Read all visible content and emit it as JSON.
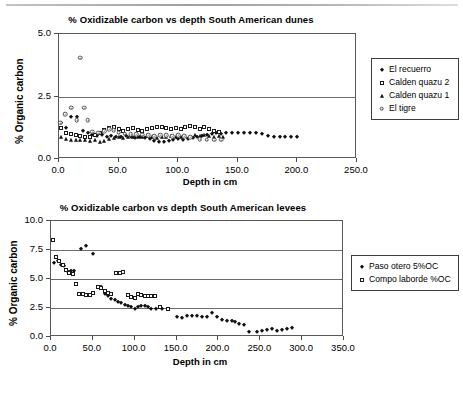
{
  "figures": [
    {
      "id": "dunes",
      "title": "% Oxidizable carbon vs depth South American dunes",
      "xlabel": "Depth in cm",
      "ylabel": "% Organic carbon",
      "xticks": [
        "0.0",
        "50.0",
        "100.0",
        "150.0",
        "200.0",
        "250.0"
      ],
      "yticks": [
        "0.0",
        "2.5",
        "5.0"
      ],
      "legend": [
        {
          "label": "El recuerro",
          "marker": "diamond"
        },
        {
          "label": "Calden quazu 2",
          "marker": "square"
        },
        {
          "label": "Calden quazu 1",
          "marker": "triangle"
        },
        {
          "label": "El tigre",
          "marker": "circle"
        }
      ]
    },
    {
      "id": "levees",
      "title": "% Oxidizable carbon vs depth South American levees",
      "xlabel": "Depth in cm",
      "ylabel": "% Organic carbon",
      "xticks": [
        "0.0",
        "50.0",
        "100.0",
        "150.0",
        "200.0",
        "250.0",
        "300.0",
        "350.0"
      ],
      "yticks": [
        "0.0",
        "2.5",
        "5.0",
        "7.5",
        "10.0"
      ],
      "legend": [
        {
          "label": "Paso otero 5%OC",
          "marker": "diamond"
        },
        {
          "label": "Compo laborde %OC",
          "marker": "square"
        }
      ]
    }
  ],
  "chart_data": [
    {
      "type": "scatter",
      "title": "% Oxidizable carbon vs depth South American dunes",
      "xlabel": "Depth in cm",
      "ylabel": "% Organic carbon",
      "xlim": [
        0,
        250
      ],
      "ylim": [
        0,
        5.0
      ],
      "xticks": [
        0,
        50,
        100,
        150,
        200,
        250
      ],
      "yticks": [
        0,
        2.5,
        5.0
      ],
      "grid": "horizontal",
      "legend_position": "right",
      "series": [
        {
          "name": "El recuerro",
          "marker": "filled-diamond",
          "color": "#111111",
          "points": [
            [
              2,
              1.45
            ],
            [
              6,
              1.25
            ],
            [
              10,
              1.7
            ],
            [
              15,
              1.7
            ],
            [
              20,
              1.12
            ],
            [
              24,
              1.05
            ],
            [
              28,
              0.95
            ],
            [
              32,
              0.92
            ],
            [
              36,
              0.95
            ],
            [
              40,
              0.88
            ],
            [
              44,
              0.92
            ],
            [
              48,
              0.88
            ],
            [
              52,
              0.9
            ],
            [
              56,
              0.92
            ],
            [
              60,
              0.88
            ],
            [
              64,
              0.86
            ],
            [
              68,
              0.9
            ],
            [
              72,
              0.85
            ],
            [
              76,
              0.8
            ],
            [
              80,
              0.72
            ],
            [
              84,
              0.68
            ],
            [
              88,
              0.7
            ],
            [
              92,
              0.74
            ],
            [
              96,
              0.78
            ],
            [
              100,
              0.8
            ],
            [
              104,
              0.76
            ],
            [
              108,
              0.82
            ],
            [
              112,
              0.86
            ],
            [
              116,
              0.9
            ],
            [
              120,
              0.92
            ],
            [
              124,
              0.95
            ],
            [
              128,
              1.0
            ],
            [
              132,
              1.05
            ],
            [
              136,
              1.02
            ],
            [
              140,
              1.05
            ],
            [
              145,
              1.05
            ],
            [
              150,
              1.05
            ],
            [
              155,
              1.05
            ],
            [
              160,
              1.05
            ],
            [
              165,
              1.05
            ],
            [
              170,
              1.02
            ],
            [
              175,
              0.92
            ],
            [
              180,
              0.88
            ],
            [
              185,
              0.88
            ],
            [
              190,
              0.88
            ],
            [
              195,
              0.88
            ],
            [
              200,
              0.9
            ]
          ]
        },
        {
          "name": "Calden quazu 2",
          "marker": "open-square",
          "color": "#1a1a1a",
          "points": [
            [
              2,
              1.25
            ],
            [
              6,
              1.05
            ],
            [
              10,
              1.0
            ],
            [
              14,
              0.95
            ],
            [
              18,
              0.92
            ],
            [
              22,
              0.9
            ],
            [
              26,
              0.9
            ],
            [
              30,
              0.95
            ],
            [
              34,
              1.05
            ],
            [
              38,
              1.15
            ],
            [
              42,
              1.25
            ],
            [
              46,
              1.3
            ],
            [
              50,
              1.2
            ],
            [
              54,
              1.12
            ],
            [
              58,
              1.2
            ],
            [
              62,
              1.25
            ],
            [
              66,
              1.15
            ],
            [
              70,
              1.12
            ],
            [
              74,
              1.2
            ],
            [
              78,
              1.25
            ],
            [
              82,
              1.3
            ],
            [
              86,
              1.28
            ],
            [
              90,
              1.25
            ],
            [
              94,
              1.22
            ],
            [
              98,
              1.25
            ],
            [
              102,
              1.22
            ],
            [
              106,
              1.28
            ],
            [
              110,
              1.32
            ],
            [
              114,
              1.28
            ],
            [
              118,
              1.22
            ],
            [
              122,
              1.3
            ],
            [
              126,
              1.2
            ],
            [
              130,
              1.12
            ],
            [
              134,
              1.08
            ]
          ]
        },
        {
          "name": "Calden quazu 1",
          "marker": "filled-triangle",
          "color": "#111111",
          "points": [
            [
              2,
              0.88
            ],
            [
              6,
              0.8
            ],
            [
              10,
              0.78
            ],
            [
              14,
              0.78
            ],
            [
              18,
              0.78
            ],
            [
              22,
              0.75
            ],
            [
              26,
              0.72
            ],
            [
              30,
              0.75
            ],
            [
              34,
              0.7
            ],
            [
              38,
              0.72
            ],
            [
              42,
              0.8
            ],
            [
              46,
              0.85
            ],
            [
              50,
              0.88
            ],
            [
              54,
              0.86
            ],
            [
              58,
              0.9
            ],
            [
              62,
              0.88
            ],
            [
              66,
              0.9
            ],
            [
              70,
              0.88
            ],
            [
              74,
              0.92
            ],
            [
              78,
              0.88
            ],
            [
              82,
              0.85
            ],
            [
              86,
              0.88
            ],
            [
              90,
              0.9
            ],
            [
              94,
              0.92
            ],
            [
              98,
              0.9
            ],
            [
              102,
              0.88
            ],
            [
              106,
              0.92
            ],
            [
              110,
              0.9
            ],
            [
              114,
              0.95
            ],
            [
              118,
              0.92
            ],
            [
              122,
              0.95
            ],
            [
              126,
              0.92
            ],
            [
              130,
              0.9
            ],
            [
              134,
              0.92
            ],
            [
              138,
              0.9
            ]
          ]
        },
        {
          "name": "El tigre",
          "marker": "open-circle",
          "color": "#4d4d4d",
          "points": [
            [
              1,
              1.45
            ],
            [
              5,
              1.8
            ],
            [
              10,
              2.05
            ],
            [
              15,
              1.55
            ],
            [
              18,
              4.05
            ],
            [
              21,
              2.05
            ],
            [
              24,
              1.55
            ],
            [
              28,
              1.1
            ],
            [
              33,
              1.05
            ],
            [
              38,
              1.12
            ],
            [
              42,
              1.2
            ],
            [
              46,
              1.15
            ],
            [
              50,
              1.05
            ],
            [
              55,
              1.02
            ],
            [
              60,
              1.0
            ],
            [
              65,
              1.0
            ],
            [
              70,
              0.98
            ],
            [
              75,
              0.95
            ],
            [
              80,
              0.92
            ],
            [
              85,
              0.95
            ],
            [
              90,
              0.95
            ],
            [
              95,
              0.92
            ],
            [
              100,
              0.95
            ],
            [
              105,
              0.92
            ],
            [
              110,
              0.88
            ],
            [
              118,
              0.8
            ],
            [
              124,
              0.78
            ],
            [
              130,
              0.78
            ],
            [
              136,
              0.78
            ]
          ]
        }
      ]
    },
    {
      "type": "scatter",
      "title": "% Oxidizable carbon vs depth South American levees",
      "xlabel": "Depth in cm",
      "ylabel": "% Organic carbon",
      "xlim": [
        0,
        350
      ],
      "ylim": [
        0,
        10.0
      ],
      "xticks": [
        0,
        50,
        100,
        150,
        200,
        250,
        300,
        350
      ],
      "yticks": [
        0,
        2.5,
        5.0,
        7.5,
        10.0
      ],
      "grid": "horizontal",
      "legend_position": "right",
      "series": [
        {
          "name": "Paso otero 5%OC",
          "marker": "filled-diamond",
          "color": "#111111",
          "points": [
            [
              3,
              6.35
            ],
            [
              8,
              6.55
            ],
            [
              12,
              6.25
            ],
            [
              16,
              6.1
            ],
            [
              20,
              5.6
            ],
            [
              24,
              5.65
            ],
            [
              28,
              5.7
            ],
            [
              36,
              7.55
            ],
            [
              42,
              7.85
            ],
            [
              50,
              7.15
            ],
            [
              56,
              4.35
            ],
            [
              60,
              4.3
            ],
            [
              64,
              3.75
            ],
            [
              68,
              3.55
            ],
            [
              72,
              3.3
            ],
            [
              76,
              3.15
            ],
            [
              80,
              3.05
            ],
            [
              84,
              2.95
            ],
            [
              88,
              2.75
            ],
            [
              92,
              2.7
            ],
            [
              96,
              2.6
            ],
            [
              100,
              2.45
            ],
            [
              104,
              2.6
            ],
            [
              108,
              2.7
            ],
            [
              112,
              2.65
            ],
            [
              116,
              2.6
            ],
            [
              120,
              2.4
            ],
            [
              126,
              2.4
            ],
            [
              132,
              2.45
            ],
            [
              140,
              2.4
            ],
            [
              150,
              1.75
            ],
            [
              156,
              1.65
            ],
            [
              162,
              1.85
            ],
            [
              168,
              1.85
            ],
            [
              174,
              1.85
            ],
            [
              180,
              1.75
            ],
            [
              186,
              1.7
            ],
            [
              192,
              2.1
            ],
            [
              198,
              1.7
            ],
            [
              204,
              1.5
            ],
            [
              210,
              1.4
            ],
            [
              216,
              1.35
            ],
            [
              220,
              1.3
            ],
            [
              225,
              1.15
            ],
            [
              230,
              1.0
            ],
            [
              236,
              0.45
            ],
            [
              246,
              0.45
            ],
            [
              252,
              0.5
            ],
            [
              258,
              0.6
            ],
            [
              264,
              0.65
            ],
            [
              270,
              0.5
            ],
            [
              276,
              0.6
            ],
            [
              282,
              0.7
            ],
            [
              288,
              0.75
            ]
          ]
        },
        {
          "name": "Compo laborde %OC",
          "marker": "open-square",
          "color": "#1a1a1a",
          "points": [
            [
              2,
              8.4
            ],
            [
              6,
              6.9
            ],
            [
              10,
              6.55
            ],
            [
              14,
              6.25
            ],
            [
              18,
              5.75
            ],
            [
              22,
              5.55
            ],
            [
              26,
              5.45
            ],
            [
              30,
              4.55
            ],
            [
              34,
              3.75
            ],
            [
              38,
              3.7
            ],
            [
              42,
              3.6
            ],
            [
              46,
              3.6
            ],
            [
              50,
              3.8
            ],
            [
              56,
              4.3
            ],
            [
              60,
              4.25
            ],
            [
              64,
              4.0
            ],
            [
              68,
              3.8
            ],
            [
              72,
              3.75
            ],
            [
              78,
              5.55
            ],
            [
              82,
              5.55
            ],
            [
              86,
              5.6
            ],
            [
              92,
              3.65
            ],
            [
              96,
              3.45
            ],
            [
              100,
              3.4
            ],
            [
              104,
              3.7
            ],
            [
              108,
              3.65
            ],
            [
              112,
              3.5
            ],
            [
              116,
              3.5
            ],
            [
              120,
              3.5
            ],
            [
              124,
              3.5
            ],
            [
              130,
              2.55
            ],
            [
              140,
              2.45
            ]
          ]
        }
      ]
    }
  ]
}
